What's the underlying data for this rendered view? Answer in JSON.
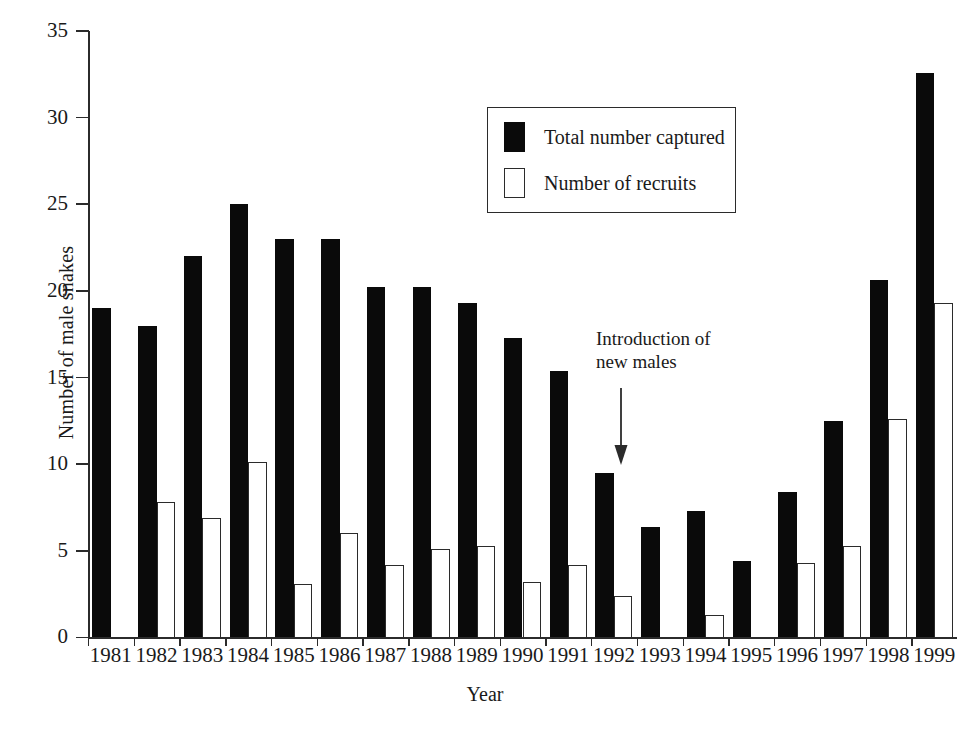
{
  "chart_data": {
    "type": "bar",
    "title": "",
    "xlabel": "Year",
    "ylabel": "Number of male snakes",
    "ylim": [
      0,
      35
    ],
    "ytick_step": 5,
    "yticks": [
      0,
      5,
      10,
      15,
      20,
      25,
      30,
      35
    ],
    "grid": false,
    "legend_position": "upper-center",
    "categories": [
      "1981",
      "1982",
      "1983",
      "1984",
      "1985",
      "1986",
      "1987",
      "1988",
      "1989",
      "1990",
      "1991",
      "1992",
      "1993",
      "1994",
      "1995",
      "1996",
      "1997",
      "1998",
      "1999"
    ],
    "series": [
      {
        "name": "Total number captured",
        "color": "#0a0a0a",
        "style": "filled",
        "values": [
          19.0,
          18.0,
          22.0,
          25.0,
          23.0,
          23.0,
          20.2,
          20.2,
          19.3,
          17.3,
          15.4,
          9.5,
          6.4,
          7.3,
          4.4,
          8.4,
          12.5,
          20.6,
          32.6
        ]
      },
      {
        "name": "Number of recruits",
        "color": "#ffffff",
        "style": "open",
        "values": [
          0.0,
          7.8,
          6.9,
          10.1,
          3.1,
          6.0,
          4.2,
          5.1,
          5.3,
          3.2,
          4.2,
          2.4,
          0.0,
          1.3,
          0.0,
          4.3,
          5.3,
          12.6,
          19.3
        ]
      }
    ],
    "annotations": [
      {
        "text": "Introduction of\nnew males",
        "points_to_category": "1992",
        "arrow": "down"
      }
    ]
  },
  "axes": {
    "y_title": "Number of male snakes",
    "x_title": "Year",
    "y_tick_labels": [
      "0",
      "5",
      "10",
      "15",
      "20",
      "25",
      "30",
      "35"
    ],
    "x_tick_labels": [
      "1981",
      "1982",
      "1983",
      "1984",
      "1985",
      "1986",
      "1987",
      "1988",
      "1989",
      "1990",
      "1991",
      "1992",
      "1993",
      "1994",
      "1995",
      "1996",
      "1997",
      "1998",
      "1999"
    ]
  },
  "legend": {
    "entries": [
      {
        "label": "Total number captured",
        "swatch": "filled-square-icon"
      },
      {
        "label": "Number of recruits",
        "swatch": "open-square-icon"
      }
    ]
  },
  "annotation": {
    "line1": "Introduction of",
    "line2": "new males",
    "arrow_icon": "down-arrow-icon"
  }
}
